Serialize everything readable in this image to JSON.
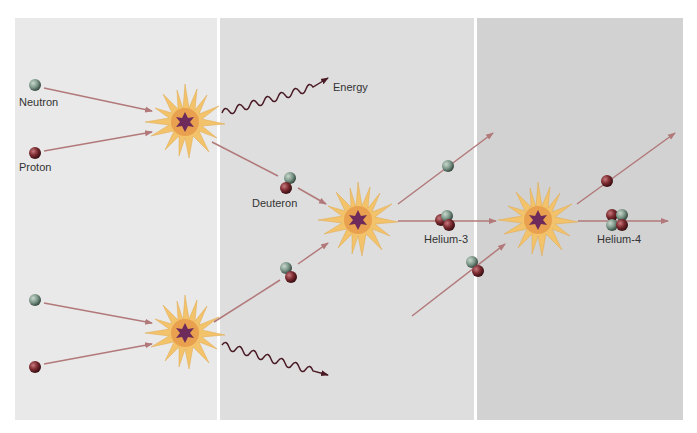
{
  "diagram": {
    "panels": [
      {
        "id": "stage-1",
        "color": "#e9e9e9"
      },
      {
        "id": "stage-2",
        "color": "#dedede"
      },
      {
        "id": "stage-3",
        "color": "#d2d2d2"
      }
    ],
    "labels": {
      "neutron": "Neutron",
      "proton": "Proton",
      "energy": "Energy",
      "deuteron": "Deuteron",
      "helium3": "Helium-3",
      "helium4": "Helium-4"
    },
    "colors": {
      "neutron": "#7f9a8c",
      "proton": "#7a2a2f",
      "arrow": "#b2797a",
      "burst_outer": "#f2c36a",
      "burst_inner": "#e79a4a",
      "burst_core": "#6d2a5a",
      "text": "#333333"
    },
    "reactions": [
      {
        "inputs": [
          "Neutron",
          "Proton"
        ],
        "outputs": [
          "Deuteron",
          "Energy"
        ]
      },
      {
        "inputs": [
          "Neutron",
          "Proton"
        ],
        "outputs": [
          "Deuteron",
          "Energy"
        ]
      },
      {
        "inputs": [
          "Deuteron",
          "Deuteron"
        ],
        "outputs": [
          "Helium-3",
          "Proton"
        ]
      },
      {
        "inputs": [
          "Helium-3",
          "Deuteron"
        ],
        "outputs": [
          "Helium-4",
          "Proton"
        ]
      }
    ]
  }
}
